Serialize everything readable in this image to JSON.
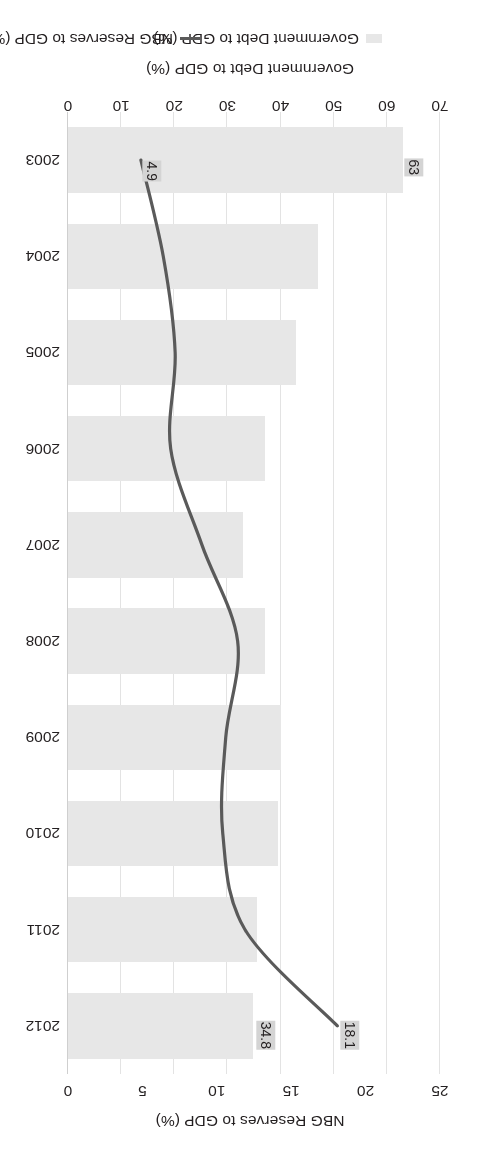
{
  "chart_data": {
    "type": "bar",
    "orientation": "horizontal-combo",
    "title": "",
    "categories": [
      "2003",
      "2004",
      "2005",
      "2006",
      "2007",
      "2008",
      "2009",
      "2010",
      "2011",
      "2012"
    ],
    "series": [
      {
        "name": "Government Debt to GDP (%)",
        "kind": "bar",
        "axis": "top",
        "color": "#e7e7e7",
        "values": [
          63.0,
          47.0,
          43.0,
          37.0,
          33.0,
          37.0,
          40.0,
          39.5,
          35.5,
          34.8
        ],
        "labels": {
          "2003": "63",
          "2012": "34.8"
        }
      },
      {
        "name": "NBG Reserves to GDP (%)",
        "kind": "line",
        "axis": "bottom",
        "color": "#5a5a5a",
        "values": [
          4.9,
          6.4,
          7.2,
          6.9,
          9.0,
          11.4,
          10.6,
          10.4,
          11.9,
          18.1
        ],
        "labels": {
          "2003": "4.9",
          "2012": "18.1"
        }
      }
    ],
    "axes": {
      "debt": {
        "label": "Government Debt to GDP (%)",
        "ticks": [
          "0",
          "10",
          "20",
          "30",
          "40",
          "50",
          "60",
          "70"
        ],
        "range": [
          0,
          70
        ],
        "position": "top-after-rotation"
      },
      "reserves": {
        "label": "NBG Reserves to GDP (%)",
        "ticks": [
          "0",
          "5",
          "10",
          "15",
          "20",
          "25"
        ],
        "range": [
          0,
          25
        ],
        "position": "bottom-after-rotation"
      }
    },
    "grid": true,
    "legend_position": "right",
    "legend": [
      {
        "label": "Government Debt to GDP (%)",
        "marker": "bar-swatch"
      },
      {
        "label": "NBG Reserves to GDP (%)",
        "marker": "line-swatch"
      }
    ]
  },
  "axis_titles": {
    "debt": "Government Debt to GDP (%)",
    "reserves": "NBG Reserves to GDP (%)"
  },
  "tick_labels": {
    "debt": [
      "0",
      "10",
      "20",
      "30",
      "40",
      "50",
      "60",
      "70"
    ],
    "reserves": [
      "0",
      "5",
      "10",
      "15",
      "20",
      "25"
    ],
    "years": [
      "2003",
      "2004",
      "2005",
      "2006",
      "2007",
      "2008",
      "2009",
      "2010",
      "2011",
      "2012"
    ]
  },
  "value_chips": {
    "debt_first": "63",
    "debt_last": "34.8",
    "res_first": "4.9",
    "res_last": "18.1"
  },
  "colors": {
    "bar": "#e7e7e7",
    "line": "#5a5a5a",
    "grid": "#e3e3e3",
    "text": "#231f20",
    "chip_bg": "#d4d4d4"
  }
}
